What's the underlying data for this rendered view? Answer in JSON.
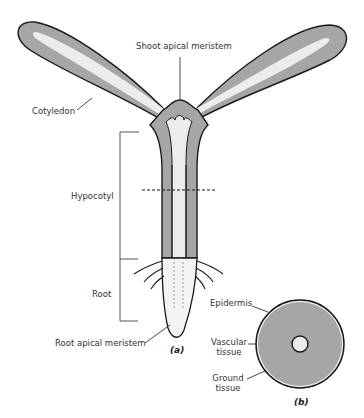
{
  "panel_a": {
    "caption": "(a)",
    "labels": {
      "shoot_apical_meristem": "Shoot apical meristem",
      "cotyledon": "Cotyledon",
      "hypocotyl": "Hypocotyl",
      "root": "Root",
      "root_apical_meristem": "Root apical meristem"
    }
  },
  "panel_b": {
    "caption": "(b)",
    "labels": {
      "epidermis": "Epidermis",
      "vascular_tissue": "Vascular tissue",
      "vascular_line1": "Vascular",
      "vascular_line2": "tissue",
      "ground_line1": "Ground",
      "ground_line2": "tissue"
    }
  },
  "colors": {
    "ground": "#a6a6a6",
    "vascular": "#ececec",
    "outline": "#1a1a1a"
  }
}
